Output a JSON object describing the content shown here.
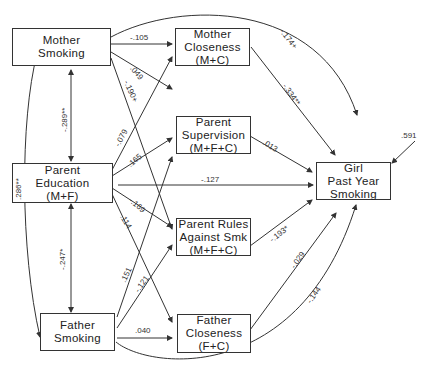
{
  "nodes": {
    "mother_smoking": [
      "Mother",
      "Smoking"
    ],
    "parent_education": [
      "Parent",
      "Education",
      "(M+F)"
    ],
    "father_smoking": [
      "Father",
      "Smoking"
    ],
    "mother_closeness": [
      "Mother",
      "Closeness",
      "(M+C)"
    ],
    "parent_supervision": [
      "Parent",
      "Supervision",
      "(M+F+C)"
    ],
    "parent_rules": [
      "Parent Rules",
      "Against Smk",
      "(M+F+C)"
    ],
    "father_closeness": [
      "Father",
      "Closeness",
      "(F+C)"
    ],
    "girl_smoking": [
      "Girl",
      "Past Year",
      "Smoking"
    ]
  },
  "paths": {
    "ms_mc": "-.105",
    "ms_ps": ".049",
    "ms_pr": "-.190+",
    "ms_girl": "-.174+",
    "pe_mc": "-.079",
    "pe_ps": ".165",
    "pe_girl": "-.127",
    "pe_pr": "-.169",
    "pe_fc": ".114",
    "fs_mc": ".151",
    "fs_pr": "-.121",
    "fs_fc": ".040",
    "fs_girl": "-.144",
    "mc_girl": "-.334**",
    "ps_girl": ".013",
    "pr_girl": "-.193*",
    "fc_girl": "-.029",
    "ms_pe_cov": "-.289**",
    "pe_fs_cov": "-.247*",
    "ms_fs_cov": ".286**",
    "residual": ".591"
  }
}
